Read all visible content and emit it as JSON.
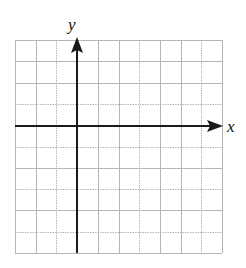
{
  "figure": {
    "type": "coordinate-grid",
    "x_axis_label": "x",
    "y_axis_label": "y",
    "grid": {
      "columns": 10,
      "rows": 10,
      "y_axis_column_index": 3,
      "x_axis_row_index": 4,
      "dotted_vertical_lines": [
        2,
        6,
        9
      ],
      "dotted_horizontal_lines": [
        3,
        5,
        7,
        9
      ]
    },
    "colors": {
      "grid_line": "#b5b5b5",
      "axis": "#1a1a1a",
      "label": "#111111",
      "background": "#ffffff"
    }
  }
}
